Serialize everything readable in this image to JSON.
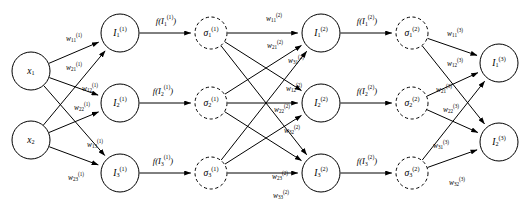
{
  "diagram": {
    "stroke_color": "#000000",
    "background_color": "#ffffff",
    "layers": [
      {
        "name": "input-layer",
        "style": "solid",
        "nodes": [
          {
            "id": "x1",
            "base": "x",
            "sub": "1",
            "sup": "",
            "cx": 31,
            "cy": 71,
            "r": 19
          },
          {
            "id": "x2",
            "base": "x",
            "sub": "2",
            "sup": "",
            "cx": 31,
            "cy": 140,
            "r": 19
          }
        ]
      },
      {
        "name": "hidden1-net-layer",
        "style": "solid",
        "nodes": [
          {
            "id": "I1_1",
            "base": "I",
            "sub": "1",
            "sup": "(1)",
            "cx": 120,
            "cy": 33,
            "r": 19
          },
          {
            "id": "I2_1",
            "base": "I",
            "sub": "2",
            "sup": "(1)",
            "cx": 120,
            "cy": 103,
            "r": 19
          },
          {
            "id": "I3_1",
            "base": "I",
            "sub": "3",
            "sup": "(1)",
            "cx": 120,
            "cy": 173,
            "r": 19
          }
        ]
      },
      {
        "name": "hidden1-activation-layer",
        "style": "dashed",
        "nodes": [
          {
            "id": "s1_1",
            "base": "σ",
            "sub": "1",
            "sup": "(1)",
            "cx": 211,
            "cy": 33,
            "r": 16
          },
          {
            "id": "s2_1",
            "base": "σ",
            "sub": "2",
            "sup": "(1)",
            "cx": 211,
            "cy": 103,
            "r": 16
          },
          {
            "id": "s3_1",
            "base": "σ",
            "sub": "3",
            "sup": "(1)",
            "cx": 211,
            "cy": 173,
            "r": 16
          }
        ]
      },
      {
        "name": "hidden2-net-layer",
        "style": "solid",
        "nodes": [
          {
            "id": "I1_2",
            "base": "I",
            "sub": "1",
            "sup": "(2)",
            "cx": 321,
            "cy": 33,
            "r": 19
          },
          {
            "id": "I2_2",
            "base": "I",
            "sub": "2",
            "sup": "(2)",
            "cx": 321,
            "cy": 103,
            "r": 19
          },
          {
            "id": "I3_2",
            "base": "I",
            "sub": "3",
            "sup": "(2)",
            "cx": 321,
            "cy": 173,
            "r": 19
          }
        ]
      },
      {
        "name": "hidden2-activation-layer",
        "style": "dashed",
        "nodes": [
          {
            "id": "s1_2",
            "base": "σ",
            "sub": "1",
            "sup": "(2)",
            "cx": 412,
            "cy": 33,
            "r": 16
          },
          {
            "id": "s2_2",
            "base": "σ",
            "sub": "2",
            "sup": "(2)",
            "cx": 412,
            "cy": 103,
            "r": 16
          },
          {
            "id": "s3_2",
            "base": "σ",
            "sub": "3",
            "sup": "(2)",
            "cx": 412,
            "cy": 173,
            "r": 16
          }
        ]
      },
      {
        "name": "output-layer",
        "style": "solid",
        "nodes": [
          {
            "id": "I1_3",
            "base": "I",
            "sub": "1",
            "sup": "(3)",
            "cx": 499,
            "cy": 63,
            "r": 19
          },
          {
            "id": "I2_3",
            "base": "I",
            "sub": "2",
            "sup": "(3)",
            "cx": 499,
            "cy": 142,
            "r": 19
          }
        ]
      }
    ],
    "edges": [
      {
        "name": "edge-x1-I1_1",
        "from": "x1",
        "to": "I1_1"
      },
      {
        "name": "edge-x1-I2_1",
        "from": "x1",
        "to": "I2_1"
      },
      {
        "name": "edge-x1-I3_1",
        "from": "x1",
        "to": "I3_1"
      },
      {
        "name": "edge-x2-I1_1",
        "from": "x2",
        "to": "I1_1"
      },
      {
        "name": "edge-x2-I2_1",
        "from": "x2",
        "to": "I2_1"
      },
      {
        "name": "edge-x2-I3_1",
        "from": "x2",
        "to": "I3_1"
      },
      {
        "name": "edge-I1_1-s1_1",
        "from": "I1_1",
        "to": "s1_1"
      },
      {
        "name": "edge-I2_1-s2_1",
        "from": "I2_1",
        "to": "s2_1"
      },
      {
        "name": "edge-I3_1-s3_1",
        "from": "I3_1",
        "to": "s3_1"
      },
      {
        "name": "edge-s1_1-I1_2",
        "from": "s1_1",
        "to": "I1_2"
      },
      {
        "name": "edge-s1_1-I2_2",
        "from": "s1_1",
        "to": "I2_2"
      },
      {
        "name": "edge-s1_1-I3_2",
        "from": "s1_1",
        "to": "I3_2"
      },
      {
        "name": "edge-s2_1-I1_2",
        "from": "s2_1",
        "to": "I1_2"
      },
      {
        "name": "edge-s2_1-I2_2",
        "from": "s2_1",
        "to": "I2_2"
      },
      {
        "name": "edge-s2_1-I3_2",
        "from": "s2_1",
        "to": "I3_2"
      },
      {
        "name": "edge-s3_1-I1_2",
        "from": "s3_1",
        "to": "I1_2"
      },
      {
        "name": "edge-s3_1-I2_2",
        "from": "s3_1",
        "to": "I2_2"
      },
      {
        "name": "edge-s3_1-I3_2",
        "from": "s3_1",
        "to": "I3_2"
      },
      {
        "name": "edge-I1_2-s1_2",
        "from": "I1_2",
        "to": "s1_2"
      },
      {
        "name": "edge-I2_2-s2_2",
        "from": "I2_2",
        "to": "s2_2"
      },
      {
        "name": "edge-I3_2-s3_2",
        "from": "I3_2",
        "to": "s3_2"
      },
      {
        "name": "edge-s1_2-I1_3",
        "from": "s1_2",
        "to": "I1_3"
      },
      {
        "name": "edge-s1_2-I2_3",
        "from": "s1_2",
        "to": "I2_3"
      },
      {
        "name": "edge-s2_2-I1_3",
        "from": "s2_2",
        "to": "I1_3"
      },
      {
        "name": "edge-s2_2-I2_3",
        "from": "s2_2",
        "to": "I2_3"
      },
      {
        "name": "edge-s3_2-I1_3",
        "from": "s3_2",
        "to": "I1_3"
      },
      {
        "name": "edge-s3_2-I2_3",
        "from": "s3_2",
        "to": "I2_3"
      }
    ],
    "weight_labels": [
      {
        "name": "weight-w11-1",
        "base": "w",
        "sub": "11",
        "sup": "(1)",
        "x": 74,
        "y": 39
      },
      {
        "name": "weight-w21-1",
        "base": "w",
        "sub": "21",
        "sup": "(1)",
        "x": 74,
        "y": 68
      },
      {
        "name": "weight-w12-1",
        "base": "w",
        "sub": "12",
        "sup": "(1)",
        "x": 90,
        "y": 89
      },
      {
        "name": "weight-w22-1",
        "base": "w",
        "sub": "22",
        "sup": "(1)",
        "x": 82,
        "y": 108
      },
      {
        "name": "weight-w13-1",
        "base": "w",
        "sub": "13",
        "sup": "(1)",
        "x": 95,
        "y": 145
      },
      {
        "name": "weight-w23-1",
        "base": "w",
        "sub": "23",
        "sup": "(1)",
        "x": 76,
        "y": 178
      },
      {
        "name": "weight-w11-2",
        "base": "w",
        "sub": "11",
        "sup": "(2)",
        "x": 274,
        "y": 19
      },
      {
        "name": "weight-w21-2",
        "base": "w",
        "sub": "21",
        "sup": "(2)",
        "x": 275,
        "y": 46
      },
      {
        "name": "weight-w31-2",
        "base": "w",
        "sub": "31",
        "sup": "(2)",
        "x": 296,
        "y": 61
      },
      {
        "name": "weight-w12-2",
        "base": "w",
        "sub": "12",
        "sup": "(2)",
        "x": 294,
        "y": 89
      },
      {
        "name": "weight-w22-2",
        "base": "w",
        "sub": "22",
        "sup": "(2)",
        "x": 282,
        "y": 110
      },
      {
        "name": "weight-w32-2",
        "base": "w",
        "sub": "32",
        "sup": "(2)",
        "x": 292,
        "y": 131
      },
      {
        "name": "weight-w23-2",
        "base": "w",
        "sub": "23",
        "sup": "(2)",
        "x": 280,
        "y": 177
      },
      {
        "name": "weight-w33-2",
        "base": "w",
        "sub": "33",
        "sup": "(2)",
        "x": 281,
        "y": 196
      },
      {
        "name": "weight-w11-3",
        "base": "w",
        "sub": "11",
        "sup": "(3)",
        "x": 455,
        "y": 34
      },
      {
        "name": "weight-w12-3",
        "base": "w",
        "sub": "12",
        "sup": "(3)",
        "x": 455,
        "y": 64
      },
      {
        "name": "weight-w21-3",
        "base": "w",
        "sub": "21",
        "sup": "(3)",
        "x": 444,
        "y": 90
      },
      {
        "name": "weight-w22-3",
        "base": "w",
        "sub": "22",
        "sup": "(3)",
        "x": 451,
        "y": 110
      },
      {
        "name": "weight-w31-3",
        "base": "w",
        "sub": "31",
        "sup": "(3)",
        "x": 441,
        "y": 146
      },
      {
        "name": "weight-w32-3",
        "base": "w",
        "sub": "32",
        "sup": "(3)",
        "x": 457,
        "y": 183
      }
    ],
    "activation_labels": [
      {
        "name": "activation-f-I1-1",
        "prefix": "f(I",
        "sub": "1",
        "sup": "(1)",
        "suffix": ")",
        "x": 166,
        "y": 22
      },
      {
        "name": "activation-f-I2-1",
        "prefix": "f(I",
        "sub": "2",
        "sup": "(1)",
        "suffix": ")",
        "x": 163,
        "y": 92
      },
      {
        "name": "activation-f-I3-1",
        "prefix": "f(I",
        "sub": "3",
        "sup": "(1)",
        "suffix": ")",
        "x": 163,
        "y": 162
      },
      {
        "name": "activation-f-I1-2",
        "prefix": "f(I",
        "sub": "1",
        "sup": "(2)",
        "suffix": ")",
        "x": 367,
        "y": 22
      },
      {
        "name": "activation-f-I2-2",
        "prefix": "f(I",
        "sub": "2",
        "sup": "(2)",
        "suffix": ")",
        "x": 367,
        "y": 92
      },
      {
        "name": "activation-f-I3-2",
        "prefix": "f(I",
        "sub": "3",
        "sup": "(2)",
        "suffix": ")",
        "x": 367,
        "y": 162
      }
    ]
  }
}
